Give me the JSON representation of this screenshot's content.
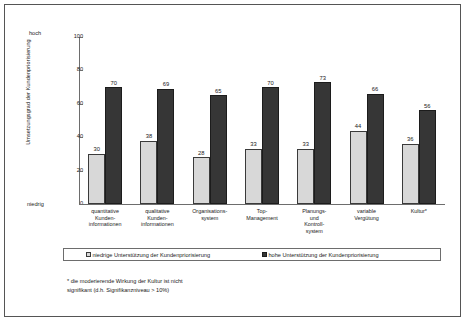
{
  "chart_data": {
    "type": "bar",
    "title": "",
    "xlabel": "",
    "ylabel": "Umsetzungsgrad der Kundenpriorisierung",
    "ylim": [
      0,
      100
    ],
    "yticks": [
      "0",
      "20",
      "40",
      "60",
      "80",
      "100"
    ],
    "grid": false,
    "legend_position": "bottom",
    "axis_endpoint_high": "hoch",
    "axis_endpoint_low": "niedrig",
    "categories": [
      "quantitative Kunden-informationen",
      "qualitative Kunden-informationen",
      "Organisations-system",
      "Top-Management",
      "Planungs- und Kontroll-system",
      "variable Vergütung",
      "Kultur*"
    ],
    "category_lines": [
      [
        "quantitative",
        "Kunden-",
        "informationen"
      ],
      [
        "qualitative",
        "Kunden-",
        "informationen"
      ],
      [
        "Organisations-",
        "system"
      ],
      [
        "Top-",
        "Management"
      ],
      [
        "Planungs-",
        "und",
        "Kontroll-",
        "system"
      ],
      [
        "variable",
        "Vergütung"
      ],
      [
        "Kultur*"
      ]
    ],
    "series": [
      {
        "name": "niedrige Unterstützung der Kundenpriorisierung",
        "color": "#d8d8d8",
        "values": [
          30,
          38,
          28,
          33,
          33,
          44,
          36
        ]
      },
      {
        "name": "hohe Unterstützung der Kundenpriorisierung",
        "color": "#363636",
        "values": [
          70,
          69,
          65,
          70,
          73,
          66,
          56
        ]
      }
    ]
  },
  "footnote": {
    "line1": "* die moderierende Wirkung der Kultur ist nicht",
    "line2": "signifikant (d.h. Signifikanzniveau > 10%)"
  }
}
